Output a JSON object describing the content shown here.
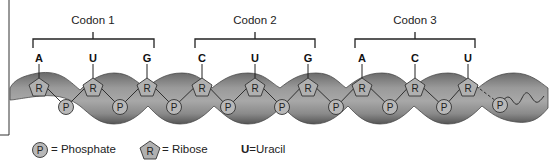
{
  "codons": [
    {
      "label": "Codon 1",
      "bases": [
        "A",
        "U",
        "G"
      ]
    },
    {
      "label": "Codon 2",
      "bases": [
        "C",
        "U",
        "G"
      ]
    },
    {
      "label": "Codon 3",
      "bases": [
        "A",
        "C",
        "U"
      ]
    }
  ],
  "ribose_symbol": "R",
  "phosphate_symbol": "P",
  "legend": {
    "phosphate": {
      "symbol": "P",
      "text": "= Phosphate"
    },
    "ribose": {
      "symbol": "R",
      "text": "= Ribose"
    },
    "uracil": {
      "symbol": "U",
      "text": "=Uracil"
    }
  },
  "colors": {
    "backbone_dark": "#5a5a5a",
    "backbone_mid": "#8c8c8c",
    "backbone_light": "#b4b4b4",
    "shape_fill": "#b0b0b0",
    "line": "#222222"
  }
}
